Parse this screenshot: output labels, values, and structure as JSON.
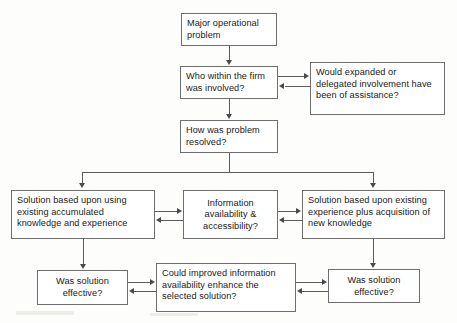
{
  "diagram": {
    "type": "flowchart",
    "title": "",
    "nodes": [
      {
        "id": "major-problem",
        "label": "Major operational problem"
      },
      {
        "id": "who-involved",
        "label": "Who within the firm was involved?"
      },
      {
        "id": "would-expanded",
        "label": "Would expanded or delegated involvement have been of assistance?"
      },
      {
        "id": "how-resolved",
        "label": "How was problem resolved?"
      },
      {
        "id": "solution-existing",
        "label": "Solution based upon using existing accumulated knowledge and experience"
      },
      {
        "id": "information-access",
        "label": "Information availability & accessibility?"
      },
      {
        "id": "solution-acquisition",
        "label": "Solution based upon existing experience plus acquisition of new knowledge"
      },
      {
        "id": "was-effective-left",
        "label": "Was solution effective?"
      },
      {
        "id": "could-improved",
        "label": "Could improved information availability enhance the selected solution?"
      },
      {
        "id": "was-effective-right",
        "label": "Was solution effective?"
      }
    ],
    "edges": [
      {
        "from": "major-problem",
        "to": "who-involved",
        "direction": "down"
      },
      {
        "from": "who-involved",
        "to": "would-expanded",
        "direction": "bidirectional"
      },
      {
        "from": "who-involved",
        "to": "how-resolved",
        "direction": "down"
      },
      {
        "from": "how-resolved",
        "to": "solution-existing",
        "direction": "down"
      },
      {
        "from": "how-resolved",
        "to": "solution-acquisition",
        "direction": "down"
      },
      {
        "from": "solution-existing",
        "to": "information-access",
        "direction": "bidirectional"
      },
      {
        "from": "information-access",
        "to": "solution-acquisition",
        "direction": "bidirectional"
      },
      {
        "from": "solution-existing",
        "to": "was-effective-left",
        "direction": "down"
      },
      {
        "from": "solution-acquisition",
        "to": "was-effective-right",
        "direction": "down"
      },
      {
        "from": "was-effective-left",
        "to": "could-improved",
        "direction": "bidirectional"
      },
      {
        "from": "could-improved",
        "to": "was-effective-right",
        "direction": "bidirectional"
      }
    ],
    "colors": {
      "box_border": "#6e6e6e",
      "box_fill": "#ffffff",
      "connector": "#5c5c5c",
      "text": "#1a1a1a",
      "page_background": "#fdfdfc"
    }
  }
}
